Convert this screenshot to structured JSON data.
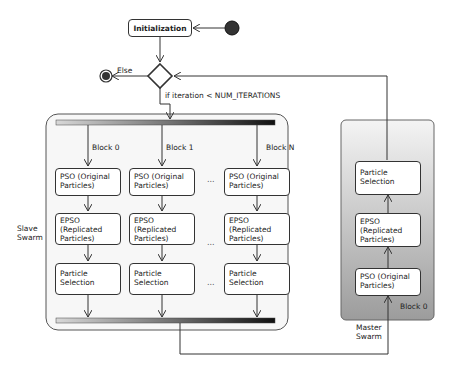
{
  "diagram": {
    "type": "activity-diagram",
    "start_node": "initial-node",
    "end_node": "final-node",
    "initialization": {
      "label": "Initialization"
    },
    "decision": {
      "else_label": "Else",
      "condition_label": "if iteration < NUM_ITERATIONS"
    },
    "slave_swarm": {
      "label_line1": "Slave",
      "label_line2": "Swarm",
      "blocks": [
        {
          "label": "Block 0",
          "steps": [
            {
              "line1": "PSO (Original",
              "line2": "Particles)",
              "line3": ""
            },
            {
              "line1": "EPSO",
              "line2": "(Replicated",
              "line3": "Particles)"
            },
            {
              "line1": "Particle",
              "line2": "Selection",
              "line3": ""
            }
          ]
        },
        {
          "label": "Block 1",
          "steps": [
            {
              "line1": "PSO (Original",
              "line2": "Particles)",
              "line3": ""
            },
            {
              "line1": "EPSO",
              "line2": "(Replicated",
              "line3": "Particles)"
            },
            {
              "line1": "Particle",
              "line2": "Selection",
              "line3": ""
            }
          ]
        },
        {
          "label": "Block N",
          "steps": [
            {
              "line1": "PSO (Original",
              "line2": "Particles)",
              "line3": ""
            },
            {
              "line1": "EPSO",
              "line2": "(Replicated",
              "line3": "Particles)"
            },
            {
              "line1": "Particle",
              "line2": "Selection",
              "line3": ""
            }
          ]
        }
      ],
      "ellipsis": "..."
    },
    "master_swarm": {
      "label_line1": "Master",
      "label_line2": "Swarm",
      "block_label": "Block 0",
      "steps": [
        {
          "line1": "PSO (Original",
          "line2": "Particles)",
          "line3": ""
        },
        {
          "line1": "EPSO",
          "line2": "(Replicated",
          "line3": "Particles)"
        },
        {
          "line1": "Particle",
          "line2": "Selection",
          "line3": ""
        }
      ]
    },
    "colors": {
      "master_gradient_top": "#f2f2f2",
      "master_gradient_bottom": "#9a9a9a",
      "slave_background": "#f7f7f7",
      "fork_bar_dark": "#111111",
      "fork_bar_light": "#e0e0e0"
    }
  }
}
